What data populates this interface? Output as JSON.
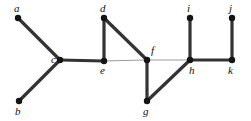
{
  "figure": {
    "kind": "undirected-graph-diagram",
    "width": 251,
    "height": 121,
    "background_color": "#ffffff"
  },
  "style": {
    "vertex_color": "#141414",
    "vertex_radius": 3.2,
    "thick_edge_color": "#333333",
    "thick_edge_width": 3.2,
    "thin_edge_color": "#9a9a9a",
    "thin_edge_width": 1.0,
    "label_color": "#111111",
    "label_font_size": 11
  },
  "graph": {
    "vertices": [
      {
        "id": "a",
        "label": "a",
        "x": 18,
        "y": 18,
        "label_x": 14,
        "label_y": 3
      },
      {
        "id": "b",
        "label": "b",
        "x": 19,
        "y": 101,
        "label_x": 15,
        "label_y": 106
      },
      {
        "id": "c",
        "label": "c",
        "x": 60,
        "y": 60,
        "label_x": 51,
        "label_y": 54
      },
      {
        "id": "d",
        "label": "d",
        "x": 104,
        "y": 18,
        "label_x": 100,
        "label_y": 3
      },
      {
        "id": "e",
        "label": "e",
        "x": 104,
        "y": 61,
        "label_x": 100,
        "label_y": 65
      },
      {
        "id": "f",
        "label": "f",
        "x": 147,
        "y": 60,
        "label_x": 151,
        "label_y": 45
      },
      {
        "id": "g",
        "label": "g",
        "x": 147,
        "y": 101,
        "label_x": 143,
        "label_y": 106
      },
      {
        "id": "h",
        "label": "h",
        "x": 190,
        "y": 60,
        "label_x": 189,
        "label_y": 65
      },
      {
        "id": "i",
        "label": "i",
        "x": 190,
        "y": 18,
        "label_x": 187,
        "label_y": 3
      },
      {
        "id": "j",
        "label": "j",
        "x": 232,
        "y": 18,
        "label_x": 229,
        "label_y": 3
      },
      {
        "id": "k",
        "label": "k",
        "x": 232,
        "y": 60,
        "label_x": 228,
        "label_y": 65
      }
    ],
    "edges": [
      {
        "from": "a",
        "to": "c",
        "weight": "thick"
      },
      {
        "from": "b",
        "to": "c",
        "weight": "thick"
      },
      {
        "from": "c",
        "to": "e",
        "weight": "thick"
      },
      {
        "from": "d",
        "to": "e",
        "weight": "thick"
      },
      {
        "from": "d",
        "to": "f",
        "weight": "thick"
      },
      {
        "from": "e",
        "to": "f",
        "weight": "thin"
      },
      {
        "from": "f",
        "to": "g",
        "weight": "thick"
      },
      {
        "from": "f",
        "to": "h",
        "weight": "thin"
      },
      {
        "from": "g",
        "to": "h",
        "weight": "thick"
      },
      {
        "from": "h",
        "to": "i",
        "weight": "thick"
      },
      {
        "from": "h",
        "to": "k",
        "weight": "thick"
      },
      {
        "from": "j",
        "to": "k",
        "weight": "thick"
      }
    ]
  }
}
